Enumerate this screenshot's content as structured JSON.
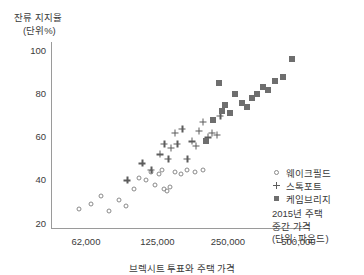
{
  "chart_data": {
    "type": "scatter",
    "title": "잔류 지지율",
    "subtitle": "(단위%)",
    "ylabel": "잔류 지지율 (단위%)",
    "xlabel": "2015년 주택 중간 가격 (단위: 파운드)",
    "xlabel_lines": [
      "2015년 주택",
      "중간 가격",
      "(단위: 파운드)"
    ],
    "xscale": "log",
    "xlim": [
      44000,
      560000
    ],
    "ylim": [
      18,
      104
    ],
    "grid": false,
    "legend_position": "right",
    "yticks": [
      20,
      40,
      60,
      80,
      100
    ],
    "ytick_labels": [
      "20",
      "40",
      "60",
      "80",
      "100"
    ],
    "xticks": [
      62000,
      125000,
      250000,
      500000
    ],
    "xtick_labels": [
      "62,000",
      "125,000",
      "250,000",
      "500,000"
    ],
    "colors": {
      "circle": "#8a8a8a",
      "plus": "#5c5c5c",
      "square": "#6e6e6e",
      "axis": "#9a9a9a",
      "text": "#3a3a3a"
    },
    "series": [
      {
        "name": "웨이크필드",
        "marker": "circle",
        "points": [
          [
            58000,
            27
          ],
          [
            65000,
            29
          ],
          [
            72000,
            33
          ],
          [
            78000,
            26
          ],
          [
            86000,
            31
          ],
          [
            92000,
            28
          ],
          [
            99000,
            36
          ],
          [
            104000,
            41
          ],
          [
            112000,
            40
          ],
          [
            118000,
            44
          ],
          [
            122000,
            38
          ],
          [
            127000,
            43
          ],
          [
            131000,
            45
          ],
          [
            134000,
            36
          ],
          [
            138000,
            35
          ],
          [
            141000,
            37
          ],
          [
            149000,
            44
          ],
          [
            158000,
            43
          ],
          [
            168000,
            45
          ],
          [
            181000,
            44
          ],
          [
            196000,
            45
          ]
        ]
      },
      {
        "name": "스톡포트",
        "marker": "plus",
        "points": [
          [
            93000,
            40
          ],
          [
            108000,
            48
          ],
          [
            118000,
            45
          ],
          [
            128000,
            52
          ],
          [
            134000,
            57
          ],
          [
            139000,
            50
          ],
          [
            143000,
            55
          ],
          [
            148000,
            62
          ],
          [
            152000,
            57
          ],
          [
            160000,
            64
          ],
          [
            168000,
            50
          ],
          [
            175000,
            58
          ],
          [
            182000,
            56
          ],
          [
            188000,
            63
          ],
          [
            196000,
            67
          ],
          [
            205000,
            60
          ],
          [
            214000,
            62
          ],
          [
            224000,
            61
          ],
          [
            232000,
            70
          ]
        ]
      },
      {
        "name": "케임브리지",
        "marker": "square",
        "points": [
          [
            201000,
            58
          ],
          [
            216000,
            68
          ],
          [
            228000,
            85
          ],
          [
            236000,
            72
          ],
          [
            244000,
            75
          ],
          [
            254000,
            71
          ],
          [
            268000,
            80
          ],
          [
            286000,
            76
          ],
          [
            302000,
            74
          ],
          [
            318000,
            78
          ],
          [
            334000,
            80
          ],
          [
            352000,
            83
          ],
          [
            372000,
            82
          ],
          [
            398000,
            86
          ],
          [
            428000,
            88
          ],
          [
            470000,
            96
          ]
        ]
      }
    ]
  },
  "legend": {
    "items": [
      {
        "label": "웨이크필드",
        "marker": "circle"
      },
      {
        "label": "스톡포트",
        "marker": "plus"
      },
      {
        "label": "케임브리지",
        "marker": "square"
      }
    ]
  },
  "caption": {
    "text": "브렉시트 투표와 주택 가격"
  }
}
